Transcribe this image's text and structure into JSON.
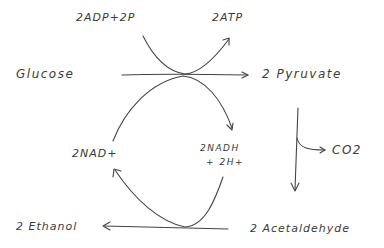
{
  "diagram": {
    "type": "hand-drawn biochemical pathway",
    "nodes": {
      "glucose": "Glucose",
      "pyruvate": "2 Pyruvate",
      "adp": "2ADP+2P",
      "atp": "2ATP",
      "nad": "2NAD+",
      "nadh_line1": "2NADH",
      "nadh_line2": "+ 2H+",
      "co2": "CO2",
      "acetaldehyde": "2 Acetaldehyde",
      "ethanol": "2 Ethanol"
    },
    "edges": [
      {
        "from": "Glucose",
        "to": "2 Pyruvate"
      },
      {
        "from": "2ADP+2P",
        "to": "2ATP",
        "coupled_to": "Glucose -> 2 Pyruvate"
      },
      {
        "from": "2NAD+",
        "to": "2NADH + 2H+",
        "coupled_to": "Glucose -> 2 Pyruvate"
      },
      {
        "from": "2 Pyruvate",
        "to": "2 Acetaldehyde",
        "byproduct": "CO2"
      },
      {
        "from": "2 Acetaldehyde",
        "to": "2 Ethanol"
      },
      {
        "from": "2NADH + 2H+",
        "to": "2NAD+",
        "coupled_to": "2 Acetaldehyde -> 2 Ethanol"
      }
    ],
    "colors": {
      "ink": "#444444",
      "background": "#ffffff"
    }
  }
}
